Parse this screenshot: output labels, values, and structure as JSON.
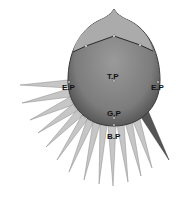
{
  "diagram": {
    "type": "head-acupoint-spike-diagram",
    "labels": {
      "top_point": "T.P",
      "ear_point_left": "E.P",
      "ear_point_right": "E.P",
      "g_point": "G.P",
      "b_point": "B.P"
    },
    "colors": {
      "head_fill": "#8a8a8a",
      "crown_fill": "#a9a9a9",
      "spike_fill": "#c4c4c4",
      "dark_spike_fill": "#5a5a5a",
      "outline": "#3a3a3a"
    },
    "spike_count": 14
  }
}
